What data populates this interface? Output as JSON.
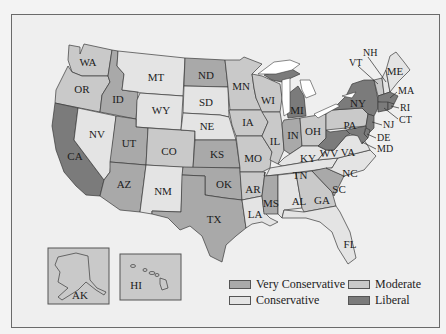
{
  "map": {
    "title": "",
    "categories": [
      {
        "key": "vc",
        "label": "Very Conservative",
        "color": "#a9a9a9"
      },
      {
        "key": "c",
        "label": "Conservative",
        "color": "#e4e4e4"
      },
      {
        "key": "m",
        "label": "Moderate",
        "color": "#c9c9c9"
      },
      {
        "key": "l",
        "label": "Liberal",
        "color": "#7b7b7b"
      }
    ],
    "states": {
      "WA": "m",
      "OR": "m",
      "CA": "l",
      "ID": "vc",
      "NV": "c",
      "MT": "c",
      "WY": "c",
      "UT": "vc",
      "AZ": "vc",
      "CO": "m",
      "NM": "c",
      "ND": "vc",
      "SD": "c",
      "NE": "c",
      "KS": "vc",
      "OK": "vc",
      "TX": "vc",
      "MN": "m",
      "IA": "m",
      "MO": "m",
      "AR": "m",
      "LA": "c",
      "WI": "m",
      "IL": "m",
      "MI": "l",
      "IN": "vc",
      "OH": "m",
      "KY": "c",
      "TN": "c",
      "MS": "vc",
      "AL": "c",
      "GA": "m",
      "FL": "c",
      "SC": "vc",
      "NC": "c",
      "VA": "c",
      "WV": "l",
      "PA": "m",
      "NY": "l",
      "VT": "m",
      "NH": "c",
      "ME": "c",
      "MA": "l",
      "RI": "l",
      "CT": "l",
      "NJ": "l",
      "DE": "l",
      "MD": "l",
      "AK": "m",
      "HI": "m"
    },
    "labels": {
      "WA": "WA",
      "OR": "OR",
      "CA": "CA",
      "ID": "ID",
      "NV": "NV",
      "MT": "MT",
      "WY": "WY",
      "UT": "UT",
      "AZ": "AZ",
      "CO": "CO",
      "NM": "NM",
      "ND": "ND",
      "SD": "SD",
      "NE": "NE",
      "KS": "KS",
      "OK": "OK",
      "TX": "TX",
      "MN": "MN",
      "IA": "IA",
      "MO": "MO",
      "AR": "AR",
      "LA": "LA",
      "WI": "WI",
      "IL": "IL",
      "MI": "MI",
      "IN": "IN",
      "OH": "OH",
      "KY": "KY",
      "TN": "TN",
      "MS": "MS",
      "AL": "AL",
      "GA": "GA",
      "FL": "FL",
      "SC": "SC",
      "NC": "NC",
      "VA": "VA",
      "WV": "WV",
      "PA": "PA",
      "NY": "NY",
      "VT": "VT",
      "NH": "NH",
      "ME": "ME",
      "MA": "MA",
      "RI": "RI",
      "CT": "CT",
      "NJ": "NJ",
      "DE": "DE",
      "MD": "MD",
      "AK": "AK",
      "HI": "HI"
    }
  },
  "legend": {
    "very_conservative": "Very Conservative",
    "conservative": "Conservative",
    "moderate": "Moderate",
    "liberal": "Liberal"
  }
}
